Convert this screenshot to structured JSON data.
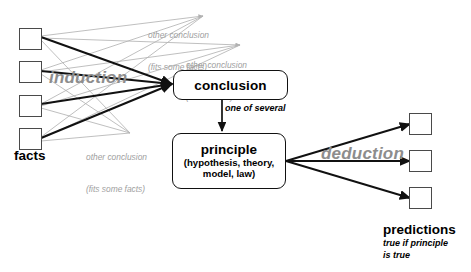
{
  "diagram": {
    "colors": {
      "line_primary": "#111111",
      "line_alternate": "#b0b0b0",
      "text_gray": "#a0a0a0",
      "flow_word": "#8d8d8d",
      "box_stroke": "#4a4a4a",
      "background": "#ffffff"
    }
  },
  "nodes": {
    "facts": {
      "label": "facts",
      "count": 4,
      "boxes": [
        {
          "name": "fact-1"
        },
        {
          "name": "fact-2"
        },
        {
          "name": "fact-3"
        },
        {
          "name": "fact-4"
        }
      ]
    },
    "conclusion": {
      "title": "conclusion"
    },
    "principle": {
      "title": "principle",
      "subtitle": "(hypothesis, theory,\nmodel, law)"
    },
    "predictions": {
      "label": "predictions",
      "sublabel": "true if principle\nis true",
      "count": 3,
      "boxes": [
        {
          "name": "prediction-1"
        },
        {
          "name": "prediction-2"
        },
        {
          "name": "prediction-3"
        }
      ]
    }
  },
  "edges": {
    "induction_label": "induction",
    "deduction_label": "deduction",
    "one_of_several_label": "one of several"
  },
  "alternate_conclusions": [
    {
      "line1": "other conclusion",
      "line2": "(fits some facts)"
    },
    {
      "line1": "other conclusion",
      "line2": "(fits all facts)"
    },
    {
      "line1": "other conclusion",
      "line2": "(fits some facts)"
    }
  ]
}
